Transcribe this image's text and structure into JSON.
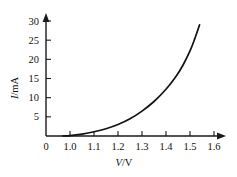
{
  "chart_data": {
    "type": "line",
    "title": "",
    "subtitle": "",
    "xlabel": "V/V",
    "xlabel_italic_part": "V",
    "xlabel_rest": "/V",
    "ylabel": "I/mA",
    "ylabel_italic_part": "I",
    "ylabel_rest": "/mA",
    "xlim": [
      0.93,
      1.68
    ],
    "ylim": [
      0,
      31
    ],
    "xticks": [
      0,
      1.0,
      1.1,
      1.2,
      1.3,
      1.4,
      1.5,
      1.6
    ],
    "xticklabels": [
      "0",
      "1.0",
      "1.1",
      "1.2",
      "1.3",
      "1.4",
      "1.5",
      "1.6"
    ],
    "yticks": [
      0,
      5,
      10,
      15,
      20,
      25,
      30
    ],
    "yticklabels": [
      "0",
      "5",
      "10",
      "15",
      "20",
      "25",
      "30"
    ],
    "grid": false,
    "legend": null,
    "legend_position": "none",
    "axis_arrows": true,
    "series": [
      {
        "name": "diode I-V characteristic",
        "color": "#121212",
        "x": [
          0.97,
          1.0,
          1.05,
          1.1,
          1.15,
          1.2,
          1.25,
          1.3,
          1.35,
          1.4,
          1.44,
          1.47,
          1.5,
          1.52,
          1.54
        ],
        "values": [
          0,
          0.1,
          0.5,
          1.1,
          1.9,
          3.0,
          4.5,
          6.5,
          9.0,
          12.2,
          15.4,
          18.4,
          22.2,
          25.4,
          29.0
        ]
      }
    ],
    "annotations": []
  },
  "figure": {
    "axis_color": "#1a1a1a",
    "curve_color": "#121212",
    "background": "#ffffff"
  }
}
